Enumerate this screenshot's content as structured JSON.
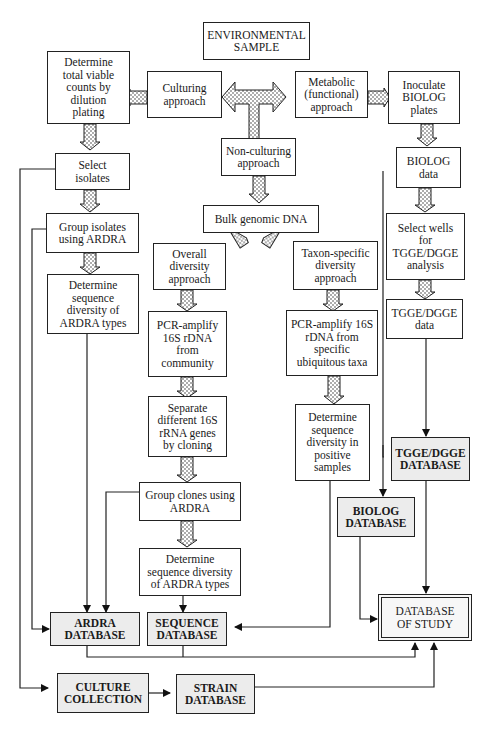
{
  "colors": {
    "line": "#222222",
    "box_fill": "#ffffff",
    "database_fill": "#ececec",
    "arrow_dots": "#444444"
  },
  "nodes": {
    "environmental_sample": "ENVIRONMENTAL\nSAMPLE",
    "culturing_approach": "Culturing\napproach",
    "metabolic_approach": "Metabolic\n(functional)\napproach",
    "non_culturing_approach": "Non-culturing\napproach",
    "determine_viable_counts": "Determine\ntotal viable\ncounts by\ndilution\nplating",
    "select_isolates": "Select\nisolates",
    "group_isolates": "Group isolates\nusing ARDRA",
    "determine_seq_div_ardra_left": "Determine\nsequence\ndiversity of\nARDRA types",
    "bulk_genomic_dna": "Bulk genomic DNA",
    "overall_diversity": "Overall\ndiversity\napproach",
    "taxon_specific": "Taxon-specific\ndiversity\napproach",
    "pcr_community": "PCR-amplify\n16S rDNA\nfrom\ncommunity",
    "pcr_specific": "PCR-amplify 16S\nrDNA from\nspecific\nubiquitous taxa",
    "separate_genes": "Separate\ndifferent 16S\nrRNA genes\nby cloning",
    "group_clones": "Group clones using\nARDRA",
    "determine_seq_div_ardra_mid": "Determine\nsequence diversity\nof ARDRA types",
    "determine_seq_div_positive": "Determine\nsequence\ndiversity in\npositive\nsamples",
    "inoculate_biolog": "Inoculate\nBIOLOG\nplates",
    "biolog_data": "BIOLOG\ndata",
    "select_wells": "Select wells\nfor\nTGGE/DGGE\nanalysis",
    "tgge_data": "TGGE/DGGE\ndata",
    "tgge_database": "TGGE/DGGE\nDATABASE",
    "biolog_database": "BIOLOG\nDATABASE",
    "ardra_database": "ARDRA\nDATABASE",
    "sequence_database": "SEQUENCE\nDATABASE",
    "culture_collection": "CULTURE\nCOLLECTION",
    "strain_database": "STRAIN\nDATABASE",
    "database_of_study": "DATABASE\nOF STUDY"
  },
  "edges": [
    {
      "from": "environmental_sample",
      "to": "culturing_approach",
      "style": "block-arrow"
    },
    {
      "from": "environmental_sample",
      "to": "metabolic_approach",
      "style": "block-arrow"
    },
    {
      "from": "environmental_sample",
      "to": "non_culturing_approach",
      "style": "block-arrow"
    },
    {
      "from": "culturing_approach",
      "to": "determine_viable_counts",
      "style": "block-arrow"
    },
    {
      "from": "determine_viable_counts",
      "to": "select_isolates",
      "style": "block-arrow"
    },
    {
      "from": "select_isolates",
      "to": "group_isolates",
      "style": "block-arrow"
    },
    {
      "from": "group_isolates",
      "to": "determine_seq_div_ardra_left",
      "style": "block-arrow"
    },
    {
      "from": "non_culturing_approach",
      "to": "bulk_genomic_dna",
      "style": "block-arrow"
    },
    {
      "from": "bulk_genomic_dna",
      "to": "overall_diversity",
      "style": "block-arrow"
    },
    {
      "from": "bulk_genomic_dna",
      "to": "taxon_specific",
      "style": "block-arrow"
    },
    {
      "from": "overall_diversity",
      "to": "pcr_community",
      "style": "block-arrow"
    },
    {
      "from": "pcr_community",
      "to": "separate_genes",
      "style": "block-arrow"
    },
    {
      "from": "separate_genes",
      "to": "group_clones",
      "style": "block-arrow"
    },
    {
      "from": "group_clones",
      "to": "determine_seq_div_ardra_mid",
      "style": "block-arrow"
    },
    {
      "from": "taxon_specific",
      "to": "pcr_specific",
      "style": "block-arrow"
    },
    {
      "from": "pcr_specific",
      "to": "determine_seq_div_positive",
      "style": "block-arrow"
    },
    {
      "from": "metabolic_approach",
      "to": "inoculate_biolog",
      "style": "block-arrow"
    },
    {
      "from": "inoculate_biolog",
      "to": "biolog_data",
      "style": "block-arrow"
    },
    {
      "from": "biolog_data",
      "to": "select_wells",
      "style": "block-arrow"
    },
    {
      "from": "select_wells",
      "to": "tgge_data",
      "style": "block-arrow"
    },
    {
      "from": "tgge_data",
      "to": "tgge_database",
      "style": "line-arrow"
    },
    {
      "from": "biolog_data",
      "to": "biolog_database",
      "style": "line-arrow"
    },
    {
      "from": "group_isolates",
      "to": "ardra_database",
      "style": "line-arrow"
    },
    {
      "from": "determine_seq_div_ardra_left",
      "to": "ardra_database",
      "style": "line-arrow"
    },
    {
      "from": "group_clones",
      "to": "ardra_database",
      "style": "line-arrow"
    },
    {
      "from": "determine_seq_div_ardra_mid",
      "to": "sequence_database",
      "style": "line-arrow"
    },
    {
      "from": "determine_seq_div_positive",
      "to": "sequence_database",
      "style": "line-arrow"
    },
    {
      "from": "select_isolates",
      "to": "culture_collection",
      "style": "line-arrow"
    },
    {
      "from": "culture_collection",
      "to": "strain_database",
      "style": "line-arrow"
    },
    {
      "from": "tgge_database",
      "to": "database_of_study",
      "style": "line-arrow"
    },
    {
      "from": "biolog_database",
      "to": "database_of_study",
      "style": "line-arrow"
    },
    {
      "from": "ardra_database",
      "to": "database_of_study",
      "style": "line-arrow"
    },
    {
      "from": "sequence_database",
      "to": "database_of_study",
      "style": "line-arrow"
    },
    {
      "from": "strain_database",
      "to": "database_of_study",
      "style": "line-arrow"
    }
  ]
}
